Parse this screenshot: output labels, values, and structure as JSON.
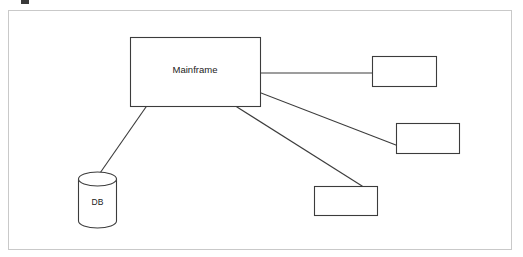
{
  "diagram": {
    "canvas": {
      "width": 523,
      "height": 257,
      "background_color": "#ffffff"
    },
    "frame": {
      "name": "outer-border",
      "x": 8,
      "y": 10,
      "width": 504,
      "height": 240,
      "stroke_color": "#c9c9c9",
      "fill_color": "#ffffff"
    },
    "style": {
      "shape_stroke_color": "#3c3c3c",
      "shape_fill_color": "#ffffff",
      "connector_color": "#3c3c3c",
      "text_color": "#1a1a1a"
    },
    "nodes": [
      {
        "id": "mainframe",
        "label": "Mainframe",
        "shape": "rectangle",
        "x": 130,
        "y": 37,
        "width": 131,
        "height": 70,
        "label_x": 195,
        "label_y": 70
      },
      {
        "id": "db",
        "label": "DB",
        "shape": "cylinder",
        "x": 78,
        "y": 172,
        "width": 38,
        "height": 56,
        "ellipse_ry": 7,
        "label_x": 97,
        "label_y": 203
      },
      {
        "id": "node-right-top",
        "label": "",
        "shape": "rectangle",
        "x": 372,
        "y": 56,
        "width": 65,
        "height": 31
      },
      {
        "id": "node-right-middle",
        "label": "",
        "shape": "rectangle",
        "x": 396,
        "y": 123,
        "width": 64,
        "height": 31
      },
      {
        "id": "node-bottom-center",
        "label": "",
        "shape": "rectangle",
        "x": 314,
        "y": 186,
        "width": 64,
        "height": 30
      }
    ],
    "connectors": [
      {
        "id": "mainframe-to-right-top",
        "from": "mainframe",
        "to": "node-right-top",
        "kind": "straight-horizontal",
        "x1": 261,
        "y1": 73,
        "x2": 372,
        "y2": 73
      },
      {
        "id": "mainframe-to-right-middle",
        "from": "mainframe",
        "to": "node-right-middle",
        "kind": "diagonal",
        "x1": 261,
        "y1": 93,
        "x2": 396,
        "y2": 145
      },
      {
        "id": "mainframe-to-bottom-center",
        "from": "mainframe",
        "to": "node-bottom-center",
        "kind": "diagonal",
        "x1": 237,
        "y1": 107,
        "x2": 362,
        "y2": 186
      },
      {
        "id": "mainframe-to-db",
        "from": "mainframe",
        "to": "db",
        "kind": "diagonal",
        "x1": 146,
        "y1": 107,
        "x2": 100,
        "y2": 173
      }
    ],
    "artifacts": [
      {
        "id": "top-crop-mark",
        "description": "partial dark glyph fragment cropped at top edge",
        "x": 21,
        "y": 0,
        "width": 8,
        "height": 4,
        "color": "#3a3a3a"
      }
    ]
  }
}
